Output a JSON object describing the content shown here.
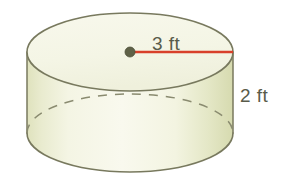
{
  "figure": {
    "kind": "cylinder-diagram",
    "radius_label": "3 ft",
    "height_label": "2 ft",
    "radius_value": 3,
    "height_value": 2,
    "units": "ft",
    "colors": {
      "background": "#ffffff",
      "body_fill": "#f4f4e3",
      "top_fill": "#f7f7ea",
      "shade_fill": "#dfe2bd",
      "outline": "#78795e",
      "hidden_outline": "#8a8b70",
      "radius_line": "#d8402a",
      "center_dot": "#5f6147",
      "label_text": "#595c4a"
    },
    "geometry": {
      "top_center_x": 130,
      "top_center_y": 52,
      "bottom_center_x": 130,
      "bottom_center_y": 133,
      "radius_x": 103,
      "radius_y": 39,
      "radius_line_from_x": 130,
      "radius_line_from_y": 52,
      "radius_line_to_x": 233,
      "radius_line_to_y": 52
    }
  }
}
